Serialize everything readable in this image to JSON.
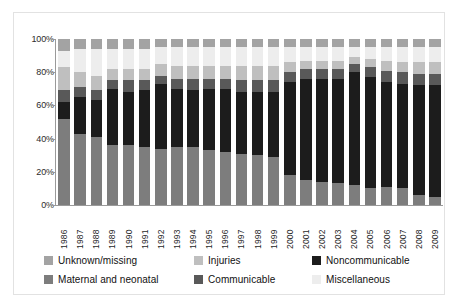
{
  "chart_data": {
    "type": "bar",
    "stacked": true,
    "stack_total": 100,
    "title": "",
    "xlabel": "",
    "ylabel": "",
    "ylim": [
      0,
      100
    ],
    "yticks": [
      "0%",
      "20%",
      "40%",
      "60%",
      "80%",
      "100%"
    ],
    "ytick_values": [
      0,
      20,
      40,
      60,
      80,
      100
    ],
    "grid": false,
    "legend_position": "bottom",
    "categories": [
      "1986",
      "1987",
      "1988",
      "1989",
      "1990",
      "1991",
      "1992",
      "1993",
      "1994",
      "1995",
      "1996",
      "1997",
      "1998",
      "1999",
      "2000",
      "2001",
      "2002",
      "2003",
      "2004",
      "2005",
      "2006",
      "2007",
      "2008",
      "2009"
    ],
    "series": [
      {
        "name": "Maternal and neonatal",
        "color": "#7d7d7d",
        "values": [
          52,
          43,
          41,
          36,
          36,
          35,
          34,
          35,
          35,
          33,
          32,
          31,
          30,
          29,
          18,
          15,
          14,
          13,
          12,
          10,
          11,
          10,
          6,
          5
        ]
      },
      {
        "name": "Noncommunicable",
        "color": "#1c1c1c",
        "values": [
          10,
          22,
          22,
          34,
          32,
          34,
          39,
          35,
          34,
          37,
          38,
          37,
          38,
          39,
          56,
          61,
          62,
          63,
          68,
          67,
          63,
          63,
          66,
          67
        ]
      },
      {
        "name": "Communicable",
        "color": "#595959",
        "values": [
          7,
          6,
          6,
          5,
          7,
          6,
          5,
          6,
          7,
          6,
          6,
          7,
          7,
          7,
          6,
          6,
          6,
          6,
          5,
          6,
          7,
          7,
          7,
          7
        ]
      },
      {
        "name": "Injuries",
        "color": "#bfbfbf",
        "values": [
          14,
          9,
          9,
          7,
          7,
          7,
          7,
          8,
          8,
          8,
          8,
          9,
          9,
          9,
          6,
          5,
          5,
          5,
          4,
          5,
          6,
          6,
          7,
          7
        ]
      },
      {
        "name": "Miscellaneous",
        "color": "#ededed",
        "values": [
          10,
          14,
          16,
          12,
          12,
          12,
          10,
          11,
          11,
          11,
          11,
          11,
          11,
          11,
          9,
          8,
          8,
          8,
          6,
          7,
          8,
          9,
          9,
          9
        ]
      },
      {
        "name": "Unknown/missing",
        "color": "#a3a3a3",
        "values": [
          7,
          6,
          6,
          6,
          6,
          6,
          5,
          5,
          5,
          5,
          5,
          5,
          5,
          5,
          5,
          5,
          5,
          5,
          5,
          5,
          5,
          5,
          5,
          5
        ]
      }
    ]
  },
  "legend": {
    "items": [
      {
        "label": "Unknown/missing",
        "color": "#a3a3a3"
      },
      {
        "label": "Injuries",
        "color": "#bfbfbf"
      },
      {
        "label": "Noncommunicable",
        "color": "#1c1c1c"
      },
      {
        "label": "Maternal and neonatal",
        "color": "#7d7d7d"
      },
      {
        "label": "Communicable",
        "color": "#595959"
      },
      {
        "label": "Miscellaneous",
        "color": "#ededed"
      }
    ]
  }
}
